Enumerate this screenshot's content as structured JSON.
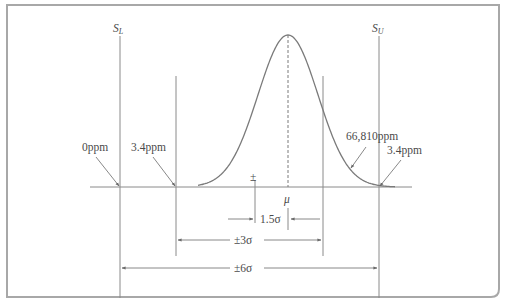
{
  "diagram": {
    "spec_limits": {
      "lower": {
        "symbol": "S",
        "subscript": "L"
      },
      "upper": {
        "symbol": "S",
        "subscript": "U"
      }
    },
    "mean_label": "μ",
    "shift_marker": "±",
    "defect_labels": {
      "outside_lower_6sigma": "0ppm",
      "outside_lower_3sigma": "3.4ppm",
      "outside_upper_3sigma": "66,810ppm",
      "outside_upper_6sigma": "3.4ppm"
    },
    "dimensions": {
      "shift": "1.5σ",
      "three_sigma": "±3σ",
      "six_sigma": "±6σ"
    },
    "colors": {
      "line": "#8a8a8a",
      "curve": "#7a7a7a",
      "frame": "#a0a0a0",
      "text": "#4a4a4a"
    }
  }
}
